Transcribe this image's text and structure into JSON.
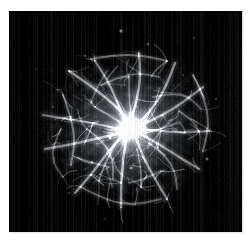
{
  "page": {
    "background_color": "#ffffff",
    "width": 252,
    "height": 240,
    "caption": ""
  },
  "image": {
    "title": "Crab Nebula",
    "alt_text": "Crab Nebula supernova remnant",
    "object_name": "Crab Nebula (M1)",
    "type": "astronomical-photograph",
    "colorization": "grayscale",
    "background_color": "#000000",
    "frame": {
      "x": 9,
      "y": 11,
      "width": 233,
      "height": 221
    },
    "nebula": {
      "center_x": 119,
      "center_y": 117,
      "radius_x": 88,
      "radius_y": 78,
      "core_brightness": 1.0,
      "peak_color": "#ffffff",
      "haze_color": "#9aa0a6"
    },
    "artifacts": {
      "vertical_striping": true,
      "striping_opacity": 0.12
    },
    "stars": [
      {
        "x": 112,
        "y": 20,
        "r": 0.9,
        "b": 0.85
      },
      {
        "x": 139,
        "y": 33,
        "r": 0.7,
        "b": 0.6
      },
      {
        "x": 76,
        "y": 45,
        "r": 0.6,
        "b": 0.5
      },
      {
        "x": 185,
        "y": 27,
        "r": 0.6,
        "b": 0.45
      },
      {
        "x": 44,
        "y": 96,
        "r": 0.6,
        "b": 0.45
      },
      {
        "x": 198,
        "y": 148,
        "r": 0.8,
        "b": 0.7
      },
      {
        "x": 60,
        "y": 182,
        "r": 0.6,
        "b": 0.45
      },
      {
        "x": 161,
        "y": 196,
        "r": 0.6,
        "b": 0.4
      },
      {
        "x": 27,
        "y": 58,
        "r": 0.5,
        "b": 0.35
      },
      {
        "x": 207,
        "y": 88,
        "r": 0.6,
        "b": 0.5
      },
      {
        "x": 96,
        "y": 208,
        "r": 0.5,
        "b": 0.35
      },
      {
        "x": 174,
        "y": 64,
        "r": 0.5,
        "b": 0.4
      },
      {
        "x": 122,
        "y": 157,
        "r": 0.7,
        "b": 0.8
      },
      {
        "x": 101,
        "y": 127,
        "r": 0.7,
        "b": 0.85
      },
      {
        "x": 83,
        "y": 151,
        "r": 0.6,
        "b": 0.6
      }
    ]
  },
  "chart_data": {
    "type": "heatmap",
    "xlabel": "",
    "ylabel": "",
    "intensity_range": [
      0,
      1
    ],
    "filaments": [
      {
        "points": [
          [
            60,
            60
          ],
          [
            78,
            72
          ],
          [
            96,
            86
          ],
          [
            112,
            100
          ],
          [
            122,
            114
          ]
        ],
        "w": 2.6,
        "b": 0.7
      },
      {
        "points": [
          [
            86,
            50
          ],
          [
            98,
            68
          ],
          [
            108,
            90
          ],
          [
            116,
            110
          ]
        ],
        "w": 2.2,
        "b": 0.62
      },
      {
        "points": [
          [
            130,
            42
          ],
          [
            132,
            64
          ],
          [
            128,
            88
          ],
          [
            122,
            110
          ]
        ],
        "w": 2.4,
        "b": 0.66
      },
      {
        "points": [
          [
            166,
            52
          ],
          [
            158,
            74
          ],
          [
            146,
            94
          ],
          [
            132,
            110
          ]
        ],
        "w": 2.4,
        "b": 0.64
      },
      {
        "points": [
          [
            194,
            76
          ],
          [
            176,
            90
          ],
          [
            154,
            104
          ],
          [
            132,
            114
          ]
        ],
        "w": 2.3,
        "b": 0.6
      },
      {
        "points": [
          [
            200,
            120
          ],
          [
            176,
            122
          ],
          [
            152,
            120
          ],
          [
            130,
            118
          ]
        ],
        "w": 2.2,
        "b": 0.58
      },
      {
        "points": [
          [
            190,
            158
          ],
          [
            170,
            146
          ],
          [
            148,
            132
          ],
          [
            130,
            122
          ]
        ],
        "w": 2.3,
        "b": 0.6
      },
      {
        "points": [
          [
            158,
            188
          ],
          [
            146,
            168
          ],
          [
            134,
            146
          ],
          [
            126,
            124
          ]
        ],
        "w": 2.4,
        "b": 0.64
      },
      {
        "points": [
          [
            112,
            196
          ],
          [
            112,
            172
          ],
          [
            114,
            148
          ],
          [
            118,
            124
          ]
        ],
        "w": 2.4,
        "b": 0.66
      },
      {
        "points": [
          [
            66,
            182
          ],
          [
            82,
            164
          ],
          [
            98,
            142
          ],
          [
            114,
            124
          ]
        ],
        "w": 2.5,
        "b": 0.66
      },
      {
        "points": [
          [
            36,
            138
          ],
          [
            60,
            134
          ],
          [
            86,
            128
          ],
          [
            112,
            122
          ]
        ],
        "w": 2.4,
        "b": 0.62
      },
      {
        "points": [
          [
            34,
            104
          ],
          [
            58,
            108
          ],
          [
            84,
            112
          ],
          [
            110,
            118
          ]
        ],
        "w": 2.2,
        "b": 0.58
      },
      {
        "points": [
          [
            54,
            84
          ],
          [
            62,
            106
          ],
          [
            66,
            130
          ],
          [
            62,
            154
          ]
        ],
        "w": 1.9,
        "b": 0.5
      },
      {
        "points": [
          [
            184,
            64
          ],
          [
            196,
            88
          ],
          [
            200,
            114
          ],
          [
            194,
            140
          ]
        ],
        "w": 1.9,
        "b": 0.48
      },
      {
        "points": [
          [
            82,
            48
          ],
          [
            106,
            44
          ],
          [
            132,
            44
          ],
          [
            158,
            50
          ]
        ],
        "w": 1.8,
        "b": 0.46
      },
      {
        "points": [
          [
            72,
            176
          ],
          [
            98,
            190
          ],
          [
            126,
            194
          ],
          [
            152,
            188
          ]
        ],
        "w": 1.8,
        "b": 0.46
      },
      {
        "points": [
          [
            92,
            74
          ],
          [
            110,
            66
          ],
          [
            130,
            62
          ],
          [
            150,
            66
          ]
        ],
        "w": 1.6,
        "b": 0.44
      },
      {
        "points": [
          [
            78,
            118
          ],
          [
            94,
            130
          ],
          [
            104,
            148
          ],
          [
            104,
            168
          ]
        ],
        "w": 1.7,
        "b": 0.46
      },
      {
        "points": [
          [
            140,
            132
          ],
          [
            156,
            144
          ],
          [
            166,
            160
          ],
          [
            168,
            178
          ]
        ],
        "w": 1.7,
        "b": 0.45
      },
      {
        "points": [
          [
            144,
            86
          ],
          [
            162,
            82
          ],
          [
            180,
            86
          ],
          [
            192,
            98
          ]
        ],
        "w": 1.6,
        "b": 0.43
      },
      {
        "points": [
          [
            52,
            118
          ],
          [
            44,
            134
          ],
          [
            44,
            152
          ],
          [
            54,
            166
          ]
        ],
        "w": 1.5,
        "b": 0.4
      },
      {
        "points": [
          [
            120,
            66
          ],
          [
            120,
            86
          ],
          [
            122,
            104
          ]
        ],
        "w": 1.5,
        "b": 0.42
      },
      {
        "points": [
          [
            86,
            96
          ],
          [
            100,
            104
          ],
          [
            112,
            112
          ]
        ],
        "w": 1.5,
        "b": 0.44
      },
      {
        "points": [
          [
            136,
            122
          ],
          [
            152,
            118
          ],
          [
            168,
            112
          ]
        ],
        "w": 1.5,
        "b": 0.42
      },
      {
        "points": [
          [
            106,
            134
          ],
          [
            96,
            152
          ],
          [
            90,
            170
          ]
        ],
        "w": 1.6,
        "b": 0.44
      },
      {
        "points": [
          [
            128,
            138
          ],
          [
            132,
            156
          ],
          [
            132,
            176
          ]
        ],
        "w": 1.6,
        "b": 0.44
      },
      {
        "points": [
          [
            66,
            146
          ],
          [
            84,
            152
          ],
          [
            100,
            156
          ]
        ],
        "w": 1.5,
        "b": 0.42
      },
      {
        "points": [
          [
            152,
            160
          ],
          [
            136,
            168
          ],
          [
            120,
            172
          ]
        ],
        "w": 1.4,
        "b": 0.4
      },
      {
        "points": [
          [
            170,
            100
          ],
          [
            182,
            108
          ],
          [
            190,
            120
          ]
        ],
        "w": 1.4,
        "b": 0.38
      },
      {
        "points": [
          [
            98,
            60
          ],
          [
            88,
            76
          ],
          [
            82,
            92
          ]
        ],
        "w": 1.4,
        "b": 0.38
      }
    ]
  }
}
